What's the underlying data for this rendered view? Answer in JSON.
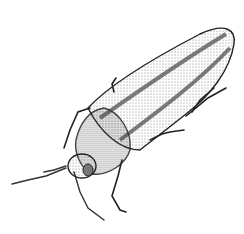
{
  "image": {
    "subject": "beetle illustration",
    "style": "stippled pen-and-ink",
    "background": "#ffffff",
    "ink": "#1a1a1a",
    "shade": "#8a8a8a"
  }
}
